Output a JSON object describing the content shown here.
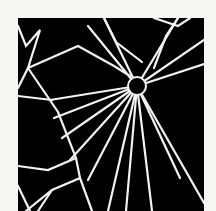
{
  "image": {
    "subject": "spider-web",
    "description": "Black-and-white high-contrast photo of a spider web with a dark central hub and radiating threads",
    "background_color": "#f6f6f4",
    "photo_color": "#000000",
    "thread_color": "#f2f2f2"
  }
}
